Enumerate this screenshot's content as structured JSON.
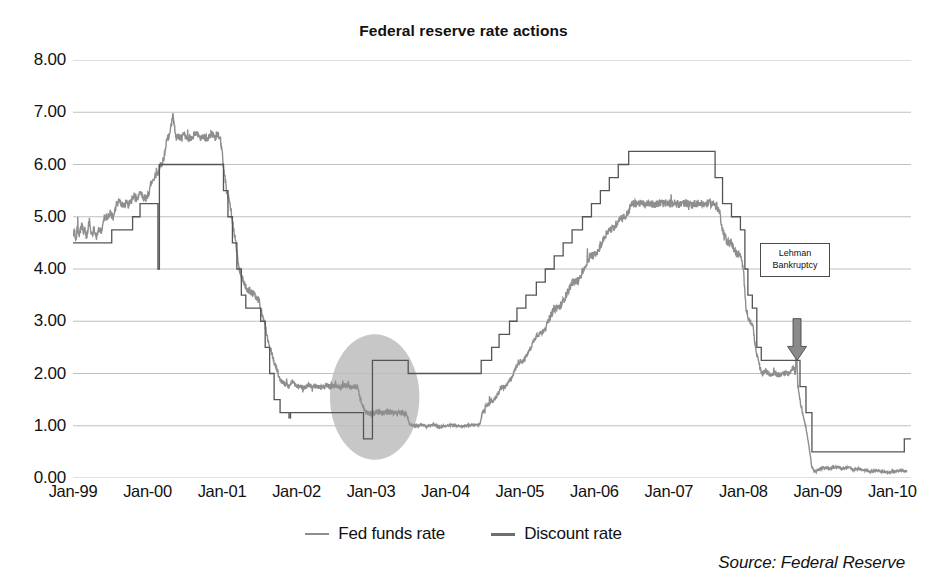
{
  "chart_data": {
    "type": "line",
    "title": "Federal reserve rate actions",
    "xlabel": "",
    "ylabel": "",
    "ylim": [
      0,
      8
    ],
    "ytick_step": 1,
    "ytick_format": "0.00",
    "grid": true,
    "legend_position": "bottom",
    "source": "Source: Federal Reserve",
    "yticks": [
      "8.00",
      "7.00",
      "6.00",
      "5.00",
      "4.00",
      "3.00",
      "2.00",
      "1.00",
      "0.00"
    ],
    "ytick_values": [
      8,
      7,
      6,
      5,
      4,
      3,
      2,
      1,
      0
    ],
    "xticks": [
      "Jan-99",
      "Jan-00",
      "Jan-01",
      "Jan-02",
      "Jan-03",
      "Jan-04",
      "Jan-05",
      "Jan-06",
      "Jan-07",
      "Jan-08",
      "Jan-09",
      "Jan-10"
    ],
    "xtick_values": [
      1999.0,
      2000.0,
      2001.0,
      2002.0,
      2003.0,
      2004.0,
      2005.0,
      2006.0,
      2007.0,
      2008.0,
      2009.0,
      2010.0
    ],
    "xlim": [
      1999.0,
      2010.25
    ],
    "series": [
      {
        "name": "Fed funds rate",
        "color": "#8e8e8e",
        "width": 1.4,
        "style": "noisy-daily",
        "points": [
          [
            1999.0,
            4.63
          ],
          [
            1999.02,
            4.7
          ],
          [
            1999.04,
            4.58
          ],
          [
            1999.06,
            4.8
          ],
          [
            1999.08,
            4.66
          ],
          [
            1999.1,
            4.74
          ],
          [
            1999.12,
            4.86
          ],
          [
            1999.14,
            4.7
          ],
          [
            1999.16,
            4.78
          ],
          [
            1999.18,
            4.62
          ],
          [
            1999.2,
            4.74
          ],
          [
            1999.22,
            4.92
          ],
          [
            1999.24,
            4.74
          ],
          [
            1999.26,
            4.66
          ],
          [
            1999.28,
            4.76
          ],
          [
            1999.3,
            4.74
          ],
          [
            1999.32,
            4.58
          ],
          [
            1999.34,
            4.76
          ],
          [
            1999.36,
            4.74
          ],
          [
            1999.38,
            4.7
          ],
          [
            1999.42,
            5.0
          ],
          [
            1999.46,
            4.98
          ],
          [
            1999.5,
            5.06
          ],
          [
            1999.54,
            5.0
          ],
          [
            1999.58,
            5.22
          ],
          [
            1999.62,
            5.3
          ],
          [
            1999.66,
            5.22
          ],
          [
            1999.7,
            5.26
          ],
          [
            1999.74,
            5.22
          ],
          [
            1999.78,
            5.3
          ],
          [
            1999.82,
            5.42
          ],
          [
            1999.86,
            5.3
          ],
          [
            1999.9,
            5.5
          ],
          [
            1999.94,
            5.4
          ],
          [
            1999.98,
            5.34
          ],
          [
            2000.02,
            5.46
          ],
          [
            2000.06,
            5.7
          ],
          [
            2000.1,
            5.78
          ],
          [
            2000.14,
            5.84
          ],
          [
            2000.18,
            6.0
          ],
          [
            2000.22,
            6.12
          ],
          [
            2000.26,
            6.48
          ],
          [
            2000.3,
            6.56
          ],
          [
            2000.34,
            6.98
          ],
          [
            2000.38,
            6.52
          ],
          [
            2000.42,
            6.54
          ],
          [
            2000.46,
            6.5
          ],
          [
            2000.5,
            6.58
          ],
          [
            2000.54,
            6.52
          ],
          [
            2000.58,
            6.5
          ],
          [
            2000.62,
            6.54
          ],
          [
            2000.66,
            6.6
          ],
          [
            2000.7,
            6.5
          ],
          [
            2000.74,
            6.56
          ],
          [
            2000.78,
            6.52
          ],
          [
            2000.82,
            6.5
          ],
          [
            2000.86,
            6.6
          ],
          [
            2000.9,
            6.54
          ],
          [
            2000.94,
            6.58
          ],
          [
            2000.98,
            6.46
          ],
          [
            2001.02,
            5.98
          ],
          [
            2001.06,
            5.52
          ],
          [
            2001.1,
            5.32
          ],
          [
            2001.14,
            4.92
          ],
          [
            2001.18,
            4.54
          ],
          [
            2001.22,
            4.08
          ],
          [
            2001.26,
            3.86
          ],
          [
            2001.3,
            3.72
          ],
          [
            2001.34,
            3.62
          ],
          [
            2001.38,
            3.58
          ],
          [
            2001.42,
            3.52
          ],
          [
            2001.46,
            3.48
          ],
          [
            2001.5,
            3.42
          ],
          [
            2001.54,
            3.1
          ],
          [
            2001.58,
            2.92
          ],
          [
            2001.62,
            2.6
          ],
          [
            2001.66,
            2.42
          ],
          [
            2001.7,
            2.22
          ],
          [
            2001.74,
            2.06
          ],
          [
            2001.78,
            1.88
          ],
          [
            2001.82,
            1.82
          ],
          [
            2001.86,
            1.78
          ],
          [
            2001.9,
            1.74
          ],
          [
            2001.94,
            1.84
          ],
          [
            2001.98,
            1.78
          ],
          [
            2002.04,
            1.76
          ],
          [
            2002.1,
            1.72
          ],
          [
            2002.16,
            1.78
          ],
          [
            2002.22,
            1.74
          ],
          [
            2002.28,
            1.76
          ],
          [
            2002.34,
            1.72
          ],
          [
            2002.4,
            1.78
          ],
          [
            2002.46,
            1.74
          ],
          [
            2002.52,
            1.76
          ],
          [
            2002.58,
            1.72
          ],
          [
            2002.64,
            1.78
          ],
          [
            2002.7,
            1.76
          ],
          [
            2002.76,
            1.74
          ],
          [
            2002.82,
            1.76
          ],
          [
            2002.88,
            1.38
          ],
          [
            2002.94,
            1.26
          ],
          [
            2003.0,
            1.24
          ],
          [
            2003.08,
            1.26
          ],
          [
            2003.16,
            1.24
          ],
          [
            2003.24,
            1.26
          ],
          [
            2003.32,
            1.24
          ],
          [
            2003.4,
            1.26
          ],
          [
            2003.48,
            1.22
          ],
          [
            2003.52,
            1.02
          ],
          [
            2003.6,
            1.0
          ],
          [
            2003.68,
            1.02
          ],
          [
            2003.76,
            0.98
          ],
          [
            2003.84,
            1.02
          ],
          [
            2003.92,
            0.98
          ],
          [
            2004.0,
            1.0
          ],
          [
            2004.1,
            1.02
          ],
          [
            2004.2,
            0.98
          ],
          [
            2004.3,
            1.0
          ],
          [
            2004.4,
            1.02
          ],
          [
            2004.46,
            1.02
          ],
          [
            2004.5,
            1.26
          ],
          [
            2004.58,
            1.44
          ],
          [
            2004.66,
            1.5
          ],
          [
            2004.74,
            1.72
          ],
          [
            2004.82,
            1.76
          ],
          [
            2004.9,
            1.96
          ],
          [
            2004.98,
            2.22
          ],
          [
            2005.06,
            2.26
          ],
          [
            2005.14,
            2.48
          ],
          [
            2005.22,
            2.74
          ],
          [
            2005.3,
            2.78
          ],
          [
            2005.38,
            3.0
          ],
          [
            2005.46,
            3.24
          ],
          [
            2005.54,
            3.28
          ],
          [
            2005.62,
            3.5
          ],
          [
            2005.7,
            3.74
          ],
          [
            2005.78,
            3.78
          ],
          [
            2005.86,
            4.0
          ],
          [
            2005.94,
            4.24
          ],
          [
            2006.02,
            4.28
          ],
          [
            2006.1,
            4.5
          ],
          [
            2006.18,
            4.74
          ],
          [
            2006.26,
            4.78
          ],
          [
            2006.34,
            4.98
          ],
          [
            2006.42,
            5.0
          ],
          [
            2006.5,
            5.24
          ],
          [
            2006.58,
            5.26
          ],
          [
            2006.66,
            5.24
          ],
          [
            2006.74,
            5.26
          ],
          [
            2006.82,
            5.24
          ],
          [
            2006.9,
            5.26
          ],
          [
            2006.98,
            5.24
          ],
          [
            2007.06,
            5.26
          ],
          [
            2007.14,
            5.24
          ],
          [
            2007.22,
            5.26
          ],
          [
            2007.3,
            5.24
          ],
          [
            2007.38,
            5.26
          ],
          [
            2007.46,
            5.24
          ],
          [
            2007.54,
            5.26
          ],
          [
            2007.62,
            5.24
          ],
          [
            2007.68,
            5.1
          ],
          [
            2007.72,
            4.76
          ],
          [
            2007.78,
            4.52
          ],
          [
            2007.84,
            4.5
          ],
          [
            2007.9,
            4.3
          ],
          [
            2007.96,
            4.26
          ],
          [
            2008.0,
            3.96
          ],
          [
            2008.04,
            3.2
          ],
          [
            2008.08,
            3.0
          ],
          [
            2008.12,
            2.98
          ],
          [
            2008.16,
            2.52
          ],
          [
            2008.2,
            2.26
          ],
          [
            2008.24,
            2.0
          ],
          [
            2008.3,
            2.04
          ],
          [
            2008.36,
            1.98
          ],
          [
            2008.42,
            2.02
          ],
          [
            2008.48,
            1.96
          ],
          [
            2008.54,
            2.02
          ],
          [
            2008.6,
            1.98
          ],
          [
            2008.64,
            2.04
          ],
          [
            2008.68,
            2.14
          ],
          [
            2008.7,
            2.0
          ],
          [
            2008.71,
            2.64
          ],
          [
            2008.73,
            1.8
          ],
          [
            2008.76,
            1.5
          ],
          [
            2008.8,
            1.2
          ],
          [
            2008.84,
            0.96
          ],
          [
            2008.88,
            0.6
          ],
          [
            2008.92,
            0.2
          ],
          [
            2008.96,
            0.12
          ],
          [
            2009.0,
            0.15
          ],
          [
            2009.08,
            0.2
          ],
          [
            2009.16,
            0.18
          ],
          [
            2009.24,
            0.22
          ],
          [
            2009.32,
            0.18
          ],
          [
            2009.4,
            0.21
          ],
          [
            2009.48,
            0.16
          ],
          [
            2009.56,
            0.18
          ],
          [
            2009.64,
            0.14
          ],
          [
            2009.72,
            0.12
          ],
          [
            2009.8,
            0.14
          ],
          [
            2009.88,
            0.12
          ],
          [
            2009.96,
            0.11
          ],
          [
            2010.04,
            0.13
          ],
          [
            2010.12,
            0.14
          ],
          [
            2010.2,
            0.13
          ]
        ]
      },
      {
        "name": "Discount rate",
        "color": "#555555",
        "width": 1.3,
        "style": "step",
        "points": [
          [
            1999.0,
            4.5
          ],
          [
            1999.5,
            4.5
          ],
          [
            1999.52,
            4.75
          ],
          [
            1999.78,
            4.75
          ],
          [
            1999.8,
            5.0
          ],
          [
            1999.88,
            5.0
          ],
          [
            1999.9,
            5.25
          ],
          [
            2000.12,
            5.25
          ],
          [
            2000.14,
            4.0
          ],
          [
            2000.16,
            6.0
          ],
          [
            2000.98,
            6.0
          ],
          [
            2001.0,
            6.0
          ],
          [
            2001.02,
            5.5
          ],
          [
            2001.08,
            5.0
          ],
          [
            2001.14,
            4.5
          ],
          [
            2001.2,
            4.0
          ],
          [
            2001.26,
            3.5
          ],
          [
            2001.32,
            3.25
          ],
          [
            2001.46,
            3.25
          ],
          [
            2001.52,
            3.0
          ],
          [
            2001.58,
            2.5
          ],
          [
            2001.64,
            2.0
          ],
          [
            2001.7,
            1.5
          ],
          [
            2001.78,
            1.25
          ],
          [
            2001.86,
            1.25
          ],
          [
            2001.9,
            1.15
          ],
          [
            2001.92,
            1.25
          ],
          [
            2002.88,
            1.25
          ],
          [
            2002.9,
            0.75
          ],
          [
            2003.0,
            0.75
          ],
          [
            2003.02,
            2.25
          ],
          [
            2003.48,
            2.25
          ],
          [
            2003.5,
            2.0
          ],
          [
            2004.46,
            2.0
          ],
          [
            2004.48,
            2.25
          ],
          [
            2004.62,
            2.5
          ],
          [
            2004.72,
            2.75
          ],
          [
            2004.86,
            3.0
          ],
          [
            2004.96,
            3.25
          ],
          [
            2005.08,
            3.5
          ],
          [
            2005.22,
            3.75
          ],
          [
            2005.34,
            4.0
          ],
          [
            2005.46,
            4.25
          ],
          [
            2005.58,
            4.5
          ],
          [
            2005.7,
            4.75
          ],
          [
            2005.84,
            5.0
          ],
          [
            2005.96,
            5.25
          ],
          [
            2006.08,
            5.5
          ],
          [
            2006.2,
            5.75
          ],
          [
            2006.32,
            6.0
          ],
          [
            2006.46,
            6.25
          ],
          [
            2007.6,
            6.25
          ],
          [
            2007.62,
            5.75
          ],
          [
            2007.72,
            5.25
          ],
          [
            2007.84,
            5.0
          ],
          [
            2007.96,
            4.75
          ],
          [
            2008.02,
            4.0
          ],
          [
            2008.06,
            3.5
          ],
          [
            2008.12,
            3.25
          ],
          [
            2008.18,
            2.5
          ],
          [
            2008.24,
            2.25
          ],
          [
            2008.5,
            2.25
          ],
          [
            2008.64,
            2.25
          ],
          [
            2008.72,
            2.25
          ],
          [
            2008.76,
            1.75
          ],
          [
            2008.84,
            1.25
          ],
          [
            2008.92,
            0.5
          ],
          [
            2010.14,
            0.5
          ],
          [
            2010.16,
            0.75
          ],
          [
            2010.25,
            0.75
          ]
        ]
      }
    ],
    "highlight_ellipse": {
      "label": "highlight-2003-rate-period",
      "cx": 2003.05,
      "cy": 1.55,
      "rx": 0.6,
      "ry": 1.2,
      "color": "#bdbdbd",
      "opacity": 0.85
    },
    "annotations": [
      {
        "name": "lehman-bankruptcy",
        "lines": [
          "Lehman",
          "Bankruptcy"
        ],
        "x": 2008.72,
        "arrow_from_y": 3.05,
        "arrow_to_y": 2.25
      }
    ]
  }
}
